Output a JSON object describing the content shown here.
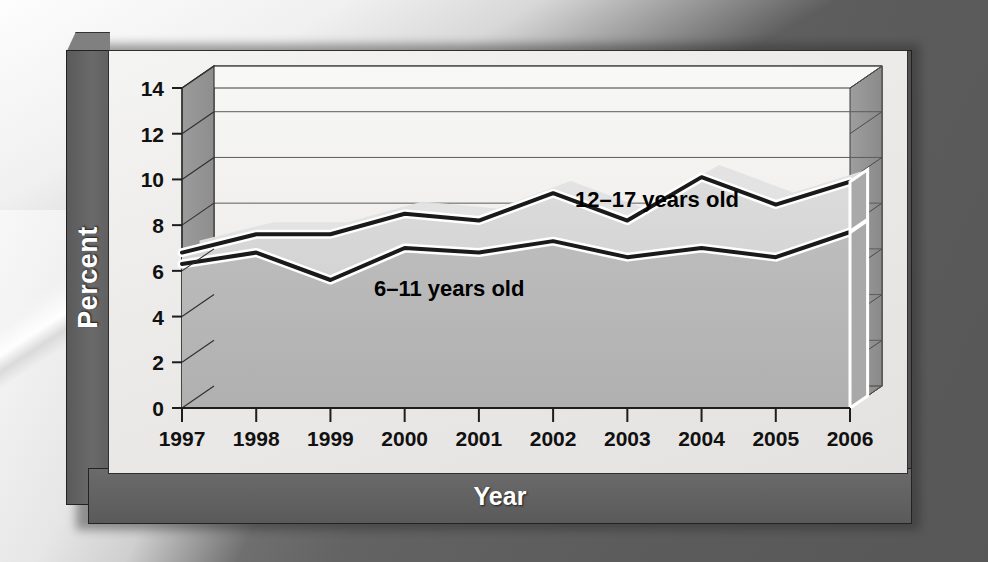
{
  "axes": {
    "y_title": "Percent",
    "x_title": "Year",
    "y_ticks": [
      "0",
      "2",
      "4",
      "6",
      "8",
      "10",
      "12",
      "14"
    ],
    "x_ticks": [
      "1997",
      "1998",
      "1999",
      "2000",
      "2001",
      "2002",
      "2003",
      "2004",
      "2005",
      "2006"
    ]
  },
  "series_labels": {
    "older": "12–17 years old",
    "younger": "6–11 years old"
  },
  "colors": {
    "panel_bg": "#efedeb",
    "frame": "#646464",
    "area_older": "#d2d2d2",
    "area_younger": "#b4b4b4",
    "line": "#1a1a1a",
    "highlight": "#ffffff",
    "background": "#5e5e5e"
  },
  "chart_data": {
    "type": "area",
    "title": "",
    "subtitle": "",
    "xlabel": "Year",
    "ylabel": "Percent",
    "xlim": [
      1997,
      2006
    ],
    "ylim": [
      0,
      14
    ],
    "ytick_step": 2,
    "grid": true,
    "legend_position": "inline-annotation",
    "style": "3d-overlapping-area",
    "x": [
      1997,
      1998,
      1999,
      2000,
      2001,
      2002,
      2003,
      2004,
      2005,
      2006
    ],
    "categories": [
      "1997",
      "1998",
      "1999",
      "2000",
      "2001",
      "2002",
      "2003",
      "2004",
      "2005",
      "2006"
    ],
    "series": [
      {
        "name": "12–17 years old",
        "values": [
          6.8,
          7.6,
          7.6,
          8.5,
          8.2,
          9.4,
          8.2,
          10.1,
          8.9,
          9.9
        ]
      },
      {
        "name": "6–11 years old",
        "values": [
          6.3,
          6.8,
          5.6,
          7.0,
          6.8,
          7.3,
          6.6,
          7.0,
          6.6,
          7.7
        ]
      }
    ],
    "annotations": [
      {
        "text": "12–17 years old",
        "x": 2003.4,
        "y": 8.8
      },
      {
        "text": "6–11 years old",
        "x": 2000.6,
        "y": 4.9
      }
    ]
  }
}
